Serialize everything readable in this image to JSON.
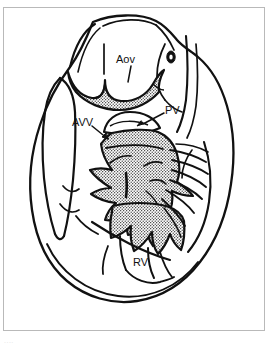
{
  "figure": {
    "frame_color": "#b9b9b9",
    "background_color": "#ffffff",
    "ink_color": "#111111",
    "stipple_color": "#1a1a1a",
    "caption_fragment": "...."
  },
  "labels": [
    {
      "id": "aov",
      "text": "Aov",
      "meaning": "aortic-valve",
      "x": 116,
      "y": 54,
      "leader": "M131,66 L128,82"
    },
    {
      "id": "pv",
      "text": "PV",
      "meaning": "pulmonary-valve",
      "x": 165,
      "y": 105,
      "leader": "M164,113 L141,125"
    },
    {
      "id": "avv",
      "text": "AVV",
      "meaning": "atrioventricular-valve",
      "x": 72,
      "y": 117,
      "leader": "M92,126 L109,140"
    },
    {
      "id": "rv",
      "text": "RV",
      "meaning": "right-ventricle",
      "x": 133,
      "y": 257,
      "leader": ""
    }
  ],
  "regions": [
    {
      "id": "aortic-cusps",
      "name": "aortic-valve-cusps",
      "fill": "stipple"
    },
    {
      "id": "central-mass",
      "name": "fibrous-body-and-septum",
      "fill": "stipple"
    },
    {
      "id": "heart-outline",
      "name": "heart-silhouette",
      "fill": "none"
    },
    {
      "id": "appendage",
      "name": "atrial-appendage",
      "fill": "none"
    },
    {
      "id": "chordae",
      "name": "chordae-tendineae",
      "fill": "none"
    },
    {
      "id": "coronary-ostium",
      "name": "coronary-ostium",
      "fill": "solid"
    }
  ]
}
